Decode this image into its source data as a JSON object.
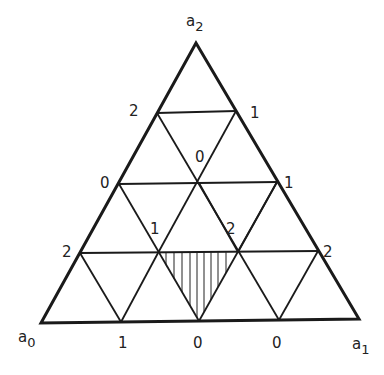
{
  "diagram": {
    "type": "simplicial subdivision of triangle (Sperner labeling)",
    "vertices": {
      "a0": {
        "base": "a",
        "sub": "0"
      },
      "a1": {
        "base": "a",
        "sub": "1"
      },
      "a2": {
        "base": "a",
        "sub": "2"
      }
    },
    "labels": [
      {
        "id": "left-2-upper",
        "text": "2"
      },
      {
        "id": "right-1-upper",
        "text": "1"
      },
      {
        "id": "center-0",
        "text": "0"
      },
      {
        "id": "left-0",
        "text": "0"
      },
      {
        "id": "right-1-mid",
        "text": "1"
      },
      {
        "id": "inner-1",
        "text": "1"
      },
      {
        "id": "inner-2",
        "text": "2"
      },
      {
        "id": "left-2-lower",
        "text": "2"
      },
      {
        "id": "right-2-lower",
        "text": "2"
      },
      {
        "id": "bottom-1",
        "text": "1"
      },
      {
        "id": "bottom-0-mid",
        "text": "0"
      },
      {
        "id": "bottom-0-right",
        "text": "0"
      }
    ],
    "shaded_triangle": "hatched with vertical lines, labels 1-2-0 (fully labeled)",
    "line_color": "#1a1a1a"
  }
}
